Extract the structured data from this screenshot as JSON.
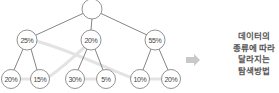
{
  "diagram": {
    "type": "search-tree",
    "root": {
      "label": ""
    },
    "level1": [
      {
        "label": "25%"
      },
      {
        "label": "20%"
      },
      {
        "label": "55%"
      }
    ],
    "level2": [
      {
        "label": "20%"
      },
      {
        "label": "15%"
      },
      {
        "label": "30%"
      },
      {
        "label": "5%"
      },
      {
        "label": "10%"
      },
      {
        "label": "20%"
      }
    ],
    "colors": {
      "edge": "#666666",
      "node_stroke": "#777777",
      "highlight_path": "#e3e3e3",
      "arrow": "#c8c8c8",
      "caption_text": "#555555"
    }
  },
  "arrow": {
    "icon": "right-arrow-icon"
  },
  "caption": {
    "lines": [
      "데이터의",
      "종류에 따라",
      "달라지는",
      "탐색방법"
    ]
  }
}
